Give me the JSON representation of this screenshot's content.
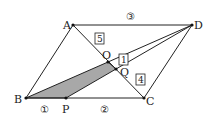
{
  "points": {
    "A": {
      "label": "A",
      "x": 73,
      "y": 25
    },
    "D": {
      "label": "D",
      "x": 192,
      "y": 25
    },
    "B": {
      "label": "B",
      "x": 26,
      "y": 98
    },
    "C": {
      "label": "C",
      "x": 144,
      "y": 98
    },
    "O": {
      "label": "O",
      "x": 108,
      "y": 62
    },
    "Q": {
      "label": "Q",
      "x": 116,
      "y": 69
    },
    "P": {
      "label": "P",
      "x": 66,
      "y": 98
    }
  },
  "ratios": {
    "AD": "③",
    "BP": "①",
    "PC": "②",
    "AO": "5",
    "OQ": "1",
    "QC": "4"
  },
  "colors": {
    "line": "#222222",
    "shade": "#a8a8a8"
  }
}
